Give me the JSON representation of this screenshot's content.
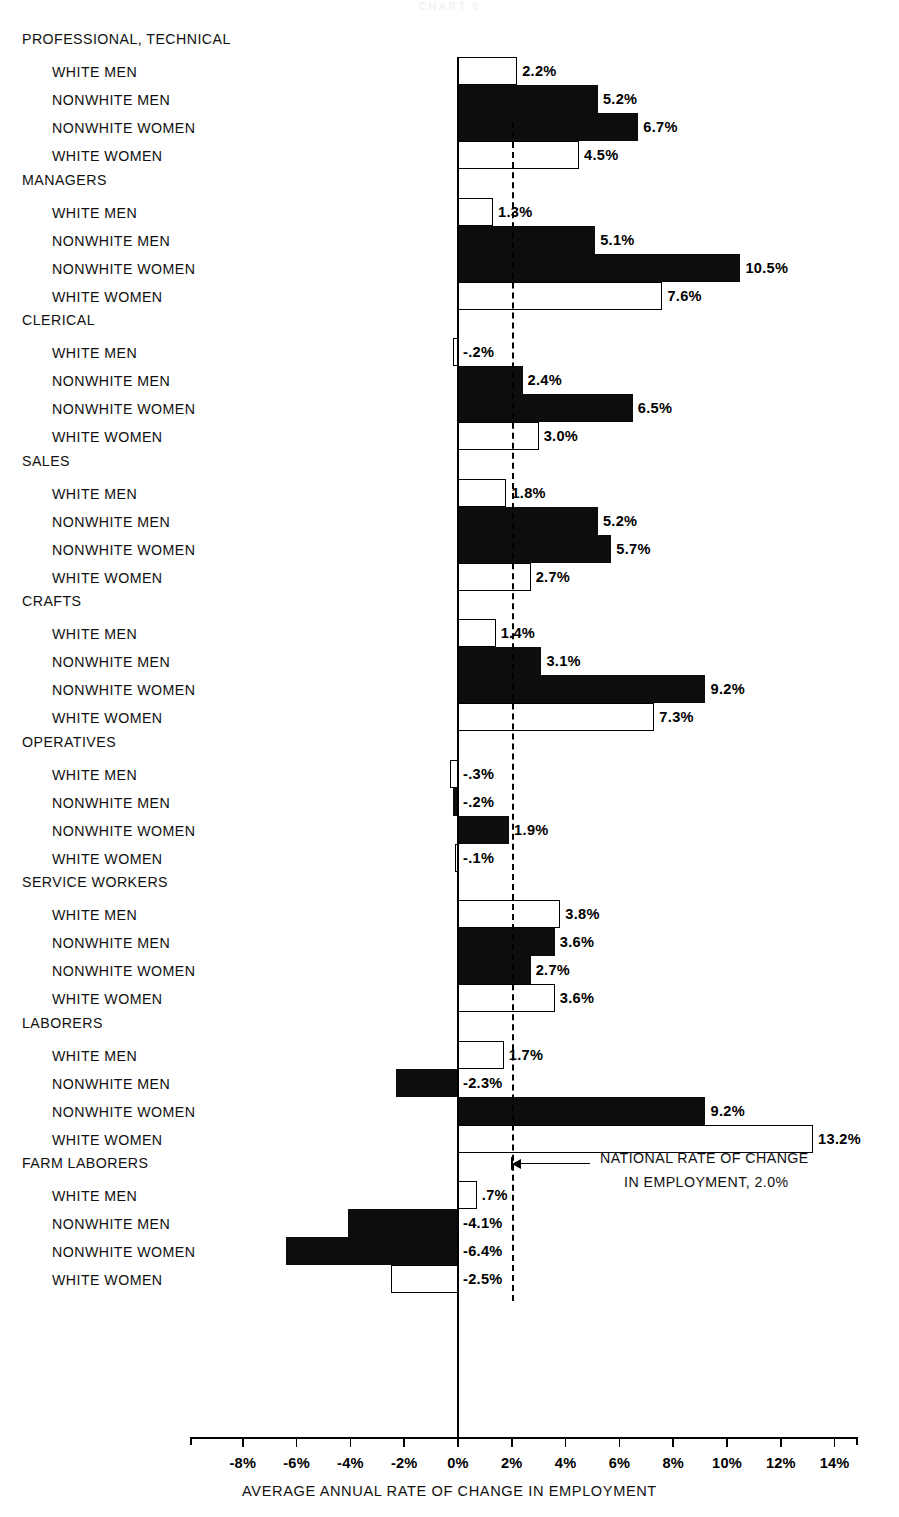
{
  "faint_header": "CHART 8",
  "chart_data": {
    "type": "bar",
    "orientation": "horizontal",
    "title": "",
    "xlabel": "AVERAGE ANNUAL RATE OF CHANGE IN EMPLOYMENT",
    "ylabel": "",
    "xlim": [
      -9.0,
      15.5
    ],
    "xticks": [
      -8,
      -6,
      -4,
      -2,
      0,
      2,
      4,
      6,
      8,
      10,
      12,
      14
    ],
    "xtick_labels": [
      "-8%",
      "-6%",
      "-4%",
      "-2%",
      "0%",
      "2%",
      "4%",
      "6%",
      "8%",
      "10%",
      "12%",
      "14%"
    ],
    "grid": false,
    "legend": [],
    "reference_line": {
      "value": 2.0,
      "style": "dashed",
      "label_line1": "NATIONAL RATE OF CHANGE",
      "label_line2": "IN EMPLOYMENT, 2.0%"
    },
    "series_styles": [
      {
        "name": "WHITE MEN",
        "fill": "open"
      },
      {
        "name": "NONWHITE MEN",
        "fill": "filled"
      },
      {
        "name": "NONWHITE WOMEN",
        "fill": "filled"
      },
      {
        "name": "WHITE WOMEN",
        "fill": "open"
      }
    ],
    "groups": [
      {
        "name": "PROFESSIONAL, TECHNICAL",
        "rows": [
          {
            "label": "WHITE MEN",
            "value": 2.2,
            "value_label": "2.2%",
            "fill": "open"
          },
          {
            "label": "NONWHITE MEN",
            "value": 5.2,
            "value_label": "5.2%",
            "fill": "filled"
          },
          {
            "label": "NONWHITE WOMEN",
            "value": 6.7,
            "value_label": "6.7%",
            "fill": "filled"
          },
          {
            "label": "WHITE WOMEN",
            "value": 4.5,
            "value_label": "4.5%",
            "fill": "open"
          }
        ]
      },
      {
        "name": "MANAGERS",
        "rows": [
          {
            "label": "WHITE MEN",
            "value": 1.3,
            "value_label": "1.3%",
            "fill": "open"
          },
          {
            "label": "NONWHITE MEN",
            "value": 5.1,
            "value_label": "5.1%",
            "fill": "filled"
          },
          {
            "label": "NONWHITE WOMEN",
            "value": 10.5,
            "value_label": "10.5%",
            "fill": "filled"
          },
          {
            "label": "WHITE WOMEN",
            "value": 7.6,
            "value_label": "7.6%",
            "fill": "open"
          }
        ]
      },
      {
        "name": "CLERICAL",
        "rows": [
          {
            "label": "WHITE MEN",
            "value": -0.2,
            "value_label": "-.2%",
            "fill": "open"
          },
          {
            "label": "NONWHITE MEN",
            "value": 2.4,
            "value_label": "2.4%",
            "fill": "filled"
          },
          {
            "label": "NONWHITE WOMEN",
            "value": 6.5,
            "value_label": "6.5%",
            "fill": "filled"
          },
          {
            "label": "WHITE WOMEN",
            "value": 3.0,
            "value_label": "3.0%",
            "fill": "open"
          }
        ]
      },
      {
        "name": "SALES",
        "rows": [
          {
            "label": "WHITE MEN",
            "value": 1.8,
            "value_label": "1.8%",
            "fill": "open"
          },
          {
            "label": "NONWHITE MEN",
            "value": 5.2,
            "value_label": "5.2%",
            "fill": "filled"
          },
          {
            "label": "NONWHITE WOMEN",
            "value": 5.7,
            "value_label": "5.7%",
            "fill": "filled"
          },
          {
            "label": "WHITE WOMEN",
            "value": 2.7,
            "value_label": "2.7%",
            "fill": "open"
          }
        ]
      },
      {
        "name": "CRAFTS",
        "rows": [
          {
            "label": "WHITE MEN",
            "value": 1.4,
            "value_label": "1.4%",
            "fill": "open"
          },
          {
            "label": "NONWHITE MEN",
            "value": 3.1,
            "value_label": "3.1%",
            "fill": "filled"
          },
          {
            "label": "NONWHITE WOMEN",
            "value": 9.2,
            "value_label": "9.2%",
            "fill": "filled"
          },
          {
            "label": "WHITE WOMEN",
            "value": 7.3,
            "value_label": "7.3%",
            "fill": "open"
          }
        ]
      },
      {
        "name": "OPERATIVES",
        "rows": [
          {
            "label": "WHITE MEN",
            "value": -0.3,
            "value_label": "-.3%",
            "fill": "open"
          },
          {
            "label": "NONWHITE MEN",
            "value": -0.2,
            "value_label": "-.2%",
            "fill": "filled"
          },
          {
            "label": "NONWHITE WOMEN",
            "value": 1.9,
            "value_label": "1.9%",
            "fill": "filled"
          },
          {
            "label": "WHITE WOMEN",
            "value": -0.1,
            "value_label": "-.1%",
            "fill": "open"
          }
        ]
      },
      {
        "name": "SERVICE WORKERS",
        "rows": [
          {
            "label": "WHITE MEN",
            "value": 3.8,
            "value_label": "3.8%",
            "fill": "open"
          },
          {
            "label": "NONWHITE MEN",
            "value": 3.6,
            "value_label": "3.6%",
            "fill": "filled"
          },
          {
            "label": "NONWHITE WOMEN",
            "value": 2.7,
            "value_label": "2.7%",
            "fill": "filled"
          },
          {
            "label": "WHITE WOMEN",
            "value": 3.6,
            "value_label": "3.6%",
            "fill": "open"
          }
        ]
      },
      {
        "name": "LABORERS",
        "rows": [
          {
            "label": "WHITE MEN",
            "value": 1.7,
            "value_label": "1.7%",
            "fill": "open"
          },
          {
            "label": "NONWHITE MEN",
            "value": -2.3,
            "value_label": "-2.3%",
            "fill": "filled"
          },
          {
            "label": "NONWHITE WOMEN",
            "value": 9.2,
            "value_label": "9.2%",
            "fill": "filled"
          },
          {
            "label": "WHITE WOMEN",
            "value": 13.2,
            "value_label": "13.2%",
            "fill": "open"
          }
        ]
      },
      {
        "name": "FARM LABORERS",
        "rows": [
          {
            "label": "WHITE MEN",
            "value": 0.7,
            "value_label": ".7%",
            "fill": "open"
          },
          {
            "label": "NONWHITE MEN",
            "value": -4.1,
            "value_label": "-4.1%",
            "fill": "filled"
          },
          {
            "label": "NONWHITE WOMEN",
            "value": -6.4,
            "value_label": "-6.4%",
            "fill": "filled"
          },
          {
            "label": "WHITE WOMEN",
            "value": -2.5,
            "value_label": "-2.5%",
            "fill": "open"
          }
        ]
      }
    ]
  }
}
